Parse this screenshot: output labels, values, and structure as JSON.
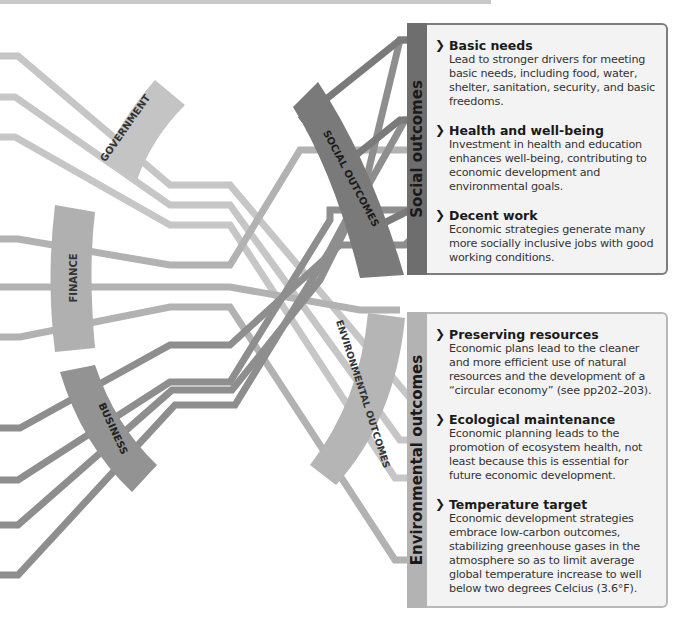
{
  "diagram": {
    "sources": [
      {
        "label": "GOVERNMENT",
        "color": "#c4c4c4"
      },
      {
        "label": "FINANCE",
        "color": "#b0b0b0"
      },
      {
        "label": "BUSINESS",
        "color": "#939393"
      }
    ],
    "outcomes": [
      {
        "label": "SOCIAL OUTCOMES",
        "color": "#7a7a7a"
      },
      {
        "label": "ENVIRONMENTAL OUTCOMES",
        "color": "#b5b5b5"
      }
    ]
  },
  "social_panel": {
    "tab_label": "Social outcomes",
    "chevron": "❯",
    "items": [
      {
        "title": "Basic needs",
        "body": "Lead to stronger drivers for meeting basic needs, including food, water, shelter, sanitation, security, and basic freedoms."
      },
      {
        "title": "Health and well-being",
        "body": "Investment in health and education enhances well-being, contributing to economic development and environmental goals."
      },
      {
        "title": "Decent work",
        "body": "Economic strategies generate many more socially inclusive jobs with good working conditions."
      }
    ]
  },
  "environmental_panel": {
    "tab_label": "Environmental outcomes",
    "chevron": "❯",
    "items": [
      {
        "title": "Preserving resources",
        "body": "Economic plans lead to the cleaner and more efficient use of natural resources and the development of a “circular economy” (see pp202–203)."
      },
      {
        "title": "Ecological maintenance",
        "body": "Economic planning leads to the promotion of ecosystem health, not least because this is essential for future economic development."
      },
      {
        "title": "Temperature target",
        "body": "Economic development strategies embrace low-carbon outcomes, stabilizing greenhouse gases in the atmosphere so as to limit average global temperature increase to well below two degrees Celcius (3.6°F)."
      }
    ]
  }
}
